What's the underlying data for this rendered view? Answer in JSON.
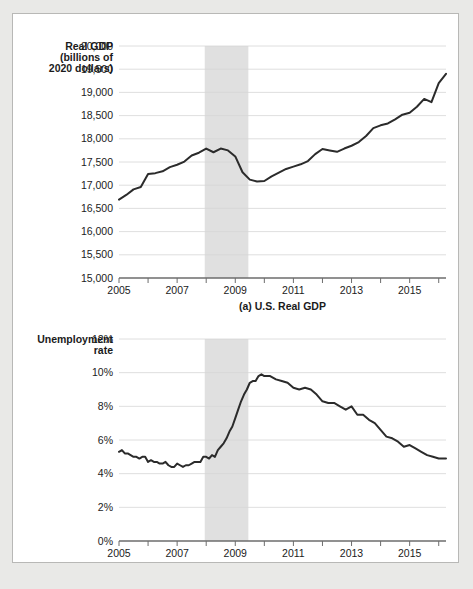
{
  "figure": {
    "panels": [
      {
        "id": "gdp",
        "caption": "(a) U.S. Real GDP",
        "axis_title_lines": [
          "Real GDP",
          "(billions of",
          "2020 dollars)"
        ]
      },
      {
        "id": "unemployment",
        "caption": "(b) U.S. Unemployment Rate",
        "axis_title_lines": [
          "Unemployment",
          "rate"
        ]
      }
    ],
    "colors": {
      "page_background": "#e9e9e7",
      "panel_background": "#ffffff",
      "panel_border": "#b8b8b6",
      "series_line": "#2b2b2b",
      "recession_band": "#e0e0e0",
      "grid_line": "#d6d6d6",
      "axis_line": "#6d6d6d"
    }
  },
  "chart_data": [
    {
      "type": "line",
      "id": "gdp",
      "title": "(a) U.S. Real GDP",
      "xlabel": "",
      "ylabel": "Real GDP (billions of 2020 dollars)",
      "xlim": [
        2005.0,
        2016.25
      ],
      "ylim": [
        15000,
        20000
      ],
      "grid": true,
      "legend": "none",
      "ytick_labels": [
        "15,000",
        "15,500",
        "16,000",
        "16,500",
        "17,000",
        "17,500",
        "18,000",
        "18,500",
        "19,000",
        "19,500",
        "20,000"
      ],
      "ytick_values": [
        15000,
        15500,
        16000,
        16500,
        17000,
        17500,
        18000,
        18500,
        19000,
        19500,
        20000
      ],
      "xtick_values": [
        2005,
        2006,
        2007,
        2008,
        2009,
        2010,
        2011,
        2012,
        2013,
        2014,
        2015,
        2016
      ],
      "xtick_labels": [
        "2005",
        "",
        "2007",
        "",
        "2009",
        "",
        "2011",
        "",
        "2013",
        "",
        "2015",
        ""
      ],
      "annotations": [
        {
          "type": "shaded_band",
          "label": "recession",
          "x_start": 2007.95,
          "x_end": 2009.45
        }
      ],
      "series": [
        {
          "name": "U.S. Real GDP",
          "x": [
            2005.0,
            2005.25,
            2005.5,
            2005.75,
            2006.0,
            2006.25,
            2006.5,
            2006.75,
            2007.0,
            2007.25,
            2007.5,
            2007.75,
            2008.0,
            2008.25,
            2008.5,
            2008.75,
            2009.0,
            2009.25,
            2009.5,
            2009.75,
            2010.0,
            2010.25,
            2010.5,
            2010.75,
            2011.0,
            2011.25,
            2011.5,
            2011.75,
            2012.0,
            2012.25,
            2012.5,
            2012.75,
            2013.0,
            2013.25,
            2013.5,
            2013.75,
            2014.0,
            2014.25,
            2014.5,
            2014.75,
            2015.0,
            2015.25,
            2015.5,
            2015.75,
            2016.0,
            2016.25
          ],
          "y": [
            16690,
            16790,
            16910,
            16960,
            17240,
            17260,
            17300,
            17390,
            17440,
            17510,
            17640,
            17700,
            17790,
            17710,
            17790,
            17750,
            17620,
            17280,
            17120,
            17080,
            17090,
            17190,
            17270,
            17350,
            17400,
            17450,
            17520,
            17670,
            17780,
            17750,
            17720,
            17790,
            17850,
            17930,
            18060,
            18230,
            18290,
            18330,
            18420,
            18520,
            18560,
            18690,
            18860,
            18790,
            19200,
            19400
          ]
        }
      ]
    },
    {
      "type": "line",
      "id": "unemployment",
      "title": "(b) U.S. Unemployment Rate",
      "xlabel": "",
      "ylabel": "Unemployment rate",
      "xlim": [
        2005.0,
        2016.25
      ],
      "ylim": [
        0,
        12
      ],
      "grid": true,
      "legend": "none",
      "ytick_labels": [
        "0%",
        "2%",
        "4%",
        "6%",
        "8%",
        "10%",
        "12%"
      ],
      "ytick_values": [
        0,
        2,
        4,
        6,
        8,
        10,
        12
      ],
      "xtick_values": [
        2005,
        2006,
        2007,
        2008,
        2009,
        2010,
        2011,
        2012,
        2013,
        2014,
        2015,
        2016
      ],
      "xtick_labels": [
        "2005",
        "",
        "2007",
        "",
        "2009",
        "",
        "2011",
        "",
        "2013",
        "",
        "2015",
        ""
      ],
      "annotations": [
        {
          "type": "shaded_band",
          "label": "recession",
          "x_start": 2007.95,
          "x_end": 2009.45
        }
      ],
      "series": [
        {
          "name": "U.S. Unemployment Rate",
          "x": [
            2005.0,
            2005.1,
            2005.2,
            2005.3,
            2005.4,
            2005.5,
            2005.6,
            2005.7,
            2005.8,
            2005.9,
            2006.0,
            2006.1,
            2006.2,
            2006.3,
            2006.4,
            2006.5,
            2006.6,
            2006.7,
            2006.8,
            2006.9,
            2007.0,
            2007.1,
            2007.2,
            2007.3,
            2007.4,
            2007.5,
            2007.6,
            2007.7,
            2007.8,
            2007.9,
            2008.0,
            2008.1,
            2008.2,
            2008.3,
            2008.4,
            2008.5,
            2008.6,
            2008.7,
            2008.8,
            2008.9,
            2009.0,
            2009.1,
            2009.2,
            2009.3,
            2009.4,
            2009.5,
            2009.6,
            2009.7,
            2009.8,
            2009.9,
            2010.0,
            2010.2,
            2010.4,
            2010.6,
            2010.8,
            2011.0,
            2011.2,
            2011.4,
            2011.6,
            2011.8,
            2012.0,
            2012.2,
            2012.4,
            2012.6,
            2012.8,
            2013.0,
            2013.2,
            2013.4,
            2013.6,
            2013.8,
            2014.0,
            2014.2,
            2014.4,
            2014.6,
            2014.8,
            2015.0,
            2015.2,
            2015.4,
            2015.6,
            2015.8,
            2016.0,
            2016.25
          ],
          "y": [
            5.3,
            5.4,
            5.2,
            5.2,
            5.1,
            5.0,
            5.0,
            4.9,
            5.0,
            5.0,
            4.7,
            4.8,
            4.7,
            4.7,
            4.6,
            4.6,
            4.7,
            4.5,
            4.4,
            4.4,
            4.6,
            4.5,
            4.4,
            4.5,
            4.5,
            4.6,
            4.7,
            4.7,
            4.7,
            5.0,
            5.0,
            4.9,
            5.1,
            5.0,
            5.4,
            5.6,
            5.8,
            6.1,
            6.5,
            6.8,
            7.3,
            7.8,
            8.3,
            8.7,
            9.0,
            9.4,
            9.5,
            9.5,
            9.8,
            9.9,
            9.8,
            9.8,
            9.6,
            9.5,
            9.4,
            9.1,
            9.0,
            9.1,
            9.0,
            8.7,
            8.3,
            8.2,
            8.2,
            8.0,
            7.8,
            8.0,
            7.5,
            7.5,
            7.2,
            7.0,
            6.6,
            6.2,
            6.1,
            5.9,
            5.6,
            5.7,
            5.5,
            5.3,
            5.1,
            5.0,
            4.9,
            4.9
          ]
        }
      ]
    }
  ]
}
